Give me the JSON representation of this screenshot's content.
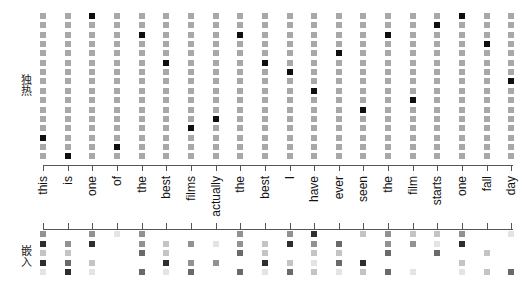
{
  "labels": {
    "onehot": "独热",
    "embedding": "嵌入"
  },
  "colors": {
    "inactive_cell": "#a8a8a8",
    "active_cell": "#0f0f0f",
    "axis": "#555555",
    "intensity_scale": [
      "#ffffff",
      "#e4e4e4",
      "#c4c4c4",
      "#929292",
      "#6a6a6a",
      "#2e2e2e"
    ]
  },
  "words": [
    "this",
    "is",
    "one",
    "of",
    "the",
    "best",
    "films",
    "actually",
    "the",
    "best",
    "I",
    "have",
    "ever",
    "seen",
    "the",
    "film",
    "starts",
    "one",
    "fall",
    "day"
  ],
  "chart_data": {
    "type": "heatmap",
    "title": "",
    "x_tick_labels": [
      "this",
      "is",
      "one",
      "of",
      "the",
      "best",
      "films",
      "actually",
      "the",
      "best",
      "I",
      "have",
      "ever",
      "seen",
      "the",
      "film",
      "starts",
      "one",
      "fall",
      "day"
    ],
    "panels": [
      {
        "name": "one-hot",
        "ylabel": "独热",
        "rows": 16,
        "active_row_index_from_top": [
          13,
          15,
          0,
          14,
          2,
          5,
          12,
          11,
          2,
          5,
          6,
          8,
          4,
          10,
          2,
          9,
          1,
          0,
          3,
          7
        ]
      },
      {
        "name": "embedding",
        "ylabel": "嵌入",
        "rows": 5,
        "intensity_levels": "0=blank .. 5=darkest",
        "values_by_word": [
          [
            3,
            5,
            2,
            5,
            1
          ],
          [
            0,
            3,
            2,
            4,
            5
          ],
          [
            3,
            5,
            0,
            2,
            1
          ],
          [
            1,
            0,
            0,
            0,
            0
          ],
          [
            3,
            3,
            4,
            0,
            4
          ],
          [
            0,
            2,
            2,
            5,
            1
          ],
          [
            0,
            3,
            0,
            3,
            4
          ],
          [
            0,
            1,
            0,
            3,
            0
          ],
          [
            3,
            3,
            4,
            0,
            4
          ],
          [
            0,
            2,
            2,
            5,
            1
          ],
          [
            3,
            5,
            0,
            2,
            4
          ],
          [
            5,
            3,
            2,
            1,
            2
          ],
          [
            0,
            4,
            2,
            4,
            1
          ],
          [
            2,
            0,
            0,
            5,
            2
          ],
          [
            3,
            3,
            4,
            0,
            4
          ],
          [
            2,
            3,
            0,
            0,
            1
          ],
          [
            2,
            1,
            4,
            0,
            0
          ],
          [
            3,
            5,
            0,
            2,
            1
          ],
          [
            0,
            0,
            2,
            0,
            2
          ],
          [
            1,
            0,
            0,
            0,
            4
          ]
        ]
      }
    ]
  }
}
